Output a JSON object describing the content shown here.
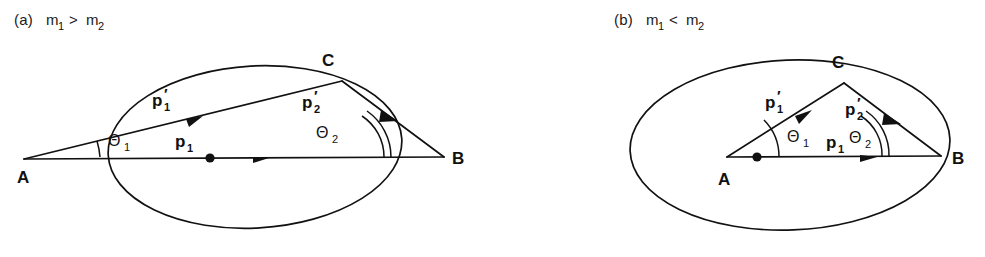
{
  "figure": {
    "type": "physics-vector-diagram",
    "background_color": "#ffffff",
    "ink_color": "#111111"
  },
  "panels": [
    {
      "id": "a",
      "caption_prefix": "(a)",
      "caption_mass_left": "m",
      "caption_mass_left_sub": "1",
      "caption_relation": ">",
      "caption_mass_right": "m",
      "caption_mass_right_sub": "2",
      "caption_full": "(a) m1 > m2",
      "vertex_a": "A",
      "vertex_b": "B",
      "vertex_c": "C",
      "label_p1": "p",
      "label_p1_sub": "1",
      "label_p1_prime": "p",
      "label_p1_prime_sub": "1",
      "label_p1_prime_mark": "′",
      "label_p2_prime": "p",
      "label_p2_prime_sub": "2",
      "label_p2_prime_mark": "′",
      "label_theta1": "Θ",
      "label_theta1_sub": "1",
      "label_theta2": "Θ",
      "label_theta2_sub": "2",
      "a_inside_ellipse": false,
      "theta2_arc_count": 2
    },
    {
      "id": "b",
      "caption_prefix": "(b)",
      "caption_mass_left": "m",
      "caption_mass_left_sub": "1",
      "caption_relation": "<",
      "caption_mass_right": "m",
      "caption_mass_right_sub": "2",
      "caption_full": "(b) m1 < m2",
      "vertex_a": "A",
      "vertex_b": "B",
      "vertex_c": "C",
      "label_p1": "p",
      "label_p1_sub": "1",
      "label_p1_prime": "p",
      "label_p1_prime_sub": "1",
      "label_p1_prime_mark": "′",
      "label_p2_prime": "p",
      "label_p2_prime_sub": "2",
      "label_p2_prime_mark": "′",
      "label_theta1": "Θ",
      "label_theta1_sub": "1",
      "label_theta2": "Θ",
      "label_theta2_sub": "2",
      "a_inside_ellipse": true,
      "theta2_arc_count": 2
    }
  ]
}
